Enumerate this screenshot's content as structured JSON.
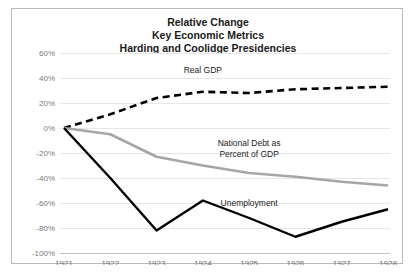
{
  "chart_data": {
    "type": "line",
    "title": "Relative Change\nKey Economic Metrics\nHarding and Coolidge Presidencies",
    "title_lines": [
      "Relative Change",
      "Key Economic Metrics",
      "Harding and Coolidge Presidencies"
    ],
    "xlabel": "",
    "ylabel": "",
    "categories": [
      "1921",
      "1922",
      "1923",
      "1924",
      "1925",
      "1926",
      "1927",
      "1928"
    ],
    "x": [
      1921,
      1922,
      1923,
      1924,
      1925,
      1926,
      1927,
      1928
    ],
    "ylim": [
      -100,
      60
    ],
    "ytick_labels": [
      "60%",
      "40%",
      "20%",
      "0%",
      "-20%",
      "-40%",
      "-60%",
      "-80%",
      "-100%"
    ],
    "ytick_values": [
      60,
      40,
      20,
      0,
      -20,
      -40,
      -60,
      -80,
      -100
    ],
    "grid": true,
    "legend": "inline-annotations",
    "series": [
      {
        "name": "Real GDP",
        "values": [
          0,
          11,
          24,
          29,
          28,
          31,
          32,
          33
        ],
        "color": "#000000",
        "style": "dashed",
        "width": 2.6,
        "label_x": 1924,
        "label_y": 44
      },
      {
        "name": "National Debt as Percent of GDP",
        "name_lines": [
          "National Debt as",
          "Percent of GDP"
        ],
        "values": [
          0,
          -5,
          -23,
          -30,
          -36,
          -39,
          -43,
          -46
        ],
        "color": "#a6a6a6",
        "style": "solid",
        "width": 2.6,
        "label_x": 1925,
        "label_y": -14
      },
      {
        "name": "Unemployment",
        "values": [
          0,
          -40,
          -82,
          -58,
          -72,
          -87,
          -75,
          -65
        ],
        "color": "#000000",
        "style": "solid",
        "width": 2.4,
        "label_x": 1925,
        "label_y": -62
      }
    ]
  },
  "annotations": {
    "real_gdp": "Real GDP",
    "national_debt_line1": "National Debt as",
    "national_debt_line2": "Percent of GDP",
    "unemployment": "Unemployment"
  },
  "colors": {
    "frame_border": "#b9b9b9",
    "gridline": "#e6e6e6",
    "axis": "#c2c2c2",
    "title_text": "#1a1a1a",
    "tick_text": "#7a7a7a",
    "series_dark": "#000000",
    "series_gray": "#a6a6a6",
    "background": "#ffffff"
  }
}
